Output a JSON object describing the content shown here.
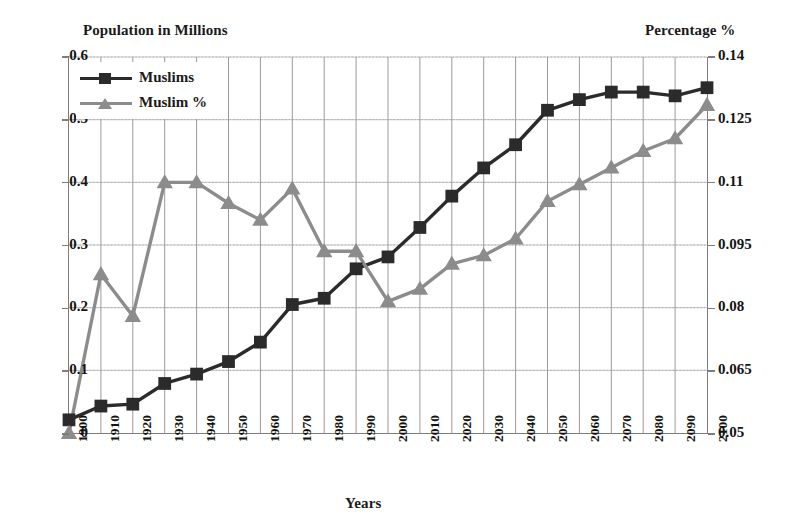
{
  "chart_data": {
    "type": "line",
    "title": "",
    "xlabel": "Years",
    "ylabel": "Population in Millions",
    "y2label": "Percentage %",
    "grid": true,
    "legend_position": "top-left",
    "x": [
      1900,
      1910,
      1920,
      1930,
      1940,
      1950,
      1960,
      1970,
      1980,
      1990,
      2000,
      2010,
      2020,
      2030,
      2040,
      2050,
      2060,
      2070,
      2080,
      2090,
      2100
    ],
    "categories": [
      "1900",
      "1910",
      "1920",
      "1930",
      "1940",
      "1950",
      "1960",
      "1970",
      "1980",
      "1990",
      "2000",
      "2010",
      "2020",
      "2030",
      "2040",
      "2050",
      "2060",
      "2070",
      "2080",
      "2090",
      "2100"
    ],
    "ylim": [
      0,
      0.6
    ],
    "yticks": [
      0,
      0.1,
      0.2,
      0.3,
      0.4,
      0.5,
      0.6
    ],
    "ytick_labels": [
      "0",
      "0.1",
      "0.2",
      "0.3",
      "0.4",
      "0.5",
      "0.6"
    ],
    "y2lim": [
      0.05,
      0.14
    ],
    "y2ticks": [
      0.05,
      0.065,
      0.08,
      0.095,
      0.11,
      0.125,
      0.14
    ],
    "y2tick_labels": [
      "0.05",
      "0.065",
      "0.08",
      "0.095",
      "0.11",
      "0.125",
      "0.14"
    ],
    "series": [
      {
        "name": "Muslims",
        "axis": "left",
        "color": "#2b2b2b",
        "marker": "square",
        "values": [
          0.021,
          0.043,
          0.046,
          0.079,
          0.094,
          0.114,
          0.145,
          0.205,
          0.215,
          0.262,
          0.281,
          0.328,
          0.378,
          0.423,
          0.46,
          0.515,
          0.532,
          0.544,
          0.544,
          0.538,
          0.551
        ]
      },
      {
        "name": "Muslim %",
        "axis": "right",
        "color": "#8c8c8c",
        "marker": "triangle",
        "values": [
          0.05,
          0.088,
          0.078,
          0.11,
          0.11,
          0.105,
          0.101,
          0.1085,
          0.0935,
          0.0935,
          0.0815,
          0.0845,
          0.0905,
          0.0925,
          0.0965,
          0.1055,
          0.1095,
          0.1135,
          0.1175,
          0.1205,
          0.1285
        ]
      }
    ]
  },
  "axes": {
    "left_title": "Population in Millions",
    "right_title": "Percentage %",
    "x_title": "Years"
  },
  "legend": {
    "items": [
      {
        "label": "Muslims",
        "marker": "square-marker-icon",
        "color": "#2b2b2b"
      },
      {
        "label": "Muslim %",
        "marker": "triangle-marker-icon",
        "color": "#8c8c8c"
      }
    ]
  },
  "colors": {
    "muslims_series": "#2b2b2b",
    "muslim_percent_series": "#8c8c8c",
    "axis_line": "#7d7d7d",
    "gridline": "#9a9a9a",
    "background": "#ffffff"
  }
}
